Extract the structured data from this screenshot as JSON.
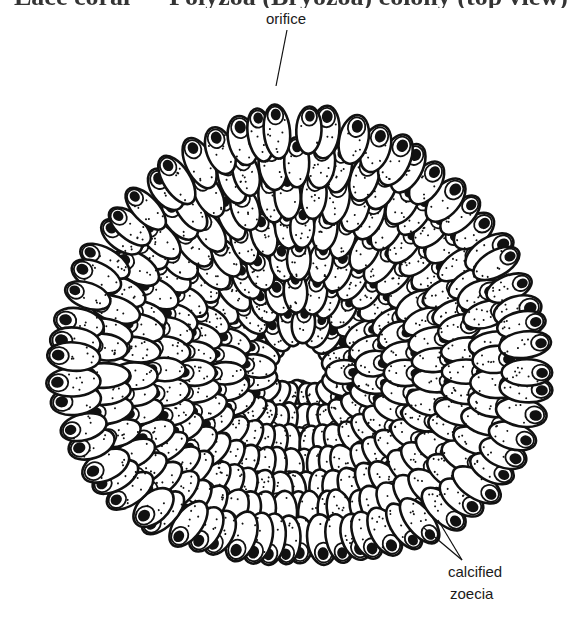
{
  "figure": {
    "title_fragment": "Lace coral — Polyzoa (Bryozoa) colony (top view)",
    "title_visible": "clipped",
    "labels": {
      "orifice": "orifice",
      "calcified": "calcified",
      "zoecia": "zoecia"
    },
    "colors": {
      "ink": "#111111",
      "background": "#ffffff",
      "zooecium_fill": "#ffffff"
    },
    "colony": {
      "center": [
        300,
        372
      ],
      "radius_x": 262,
      "radius_y": 250,
      "top_peak": [
        287,
        92
      ],
      "rings": 8,
      "zooecium_length": 46,
      "zooecium_width": 26
    },
    "leaders": {
      "orifice": {
        "from": [
          287,
          30
        ],
        "to": [
          276,
          86
        ]
      },
      "calcified": [
        {
          "from": [
            462,
            560
          ],
          "to": [
            424,
            528
          ]
        },
        {
          "from": [
            462,
            560
          ],
          "to": [
            438,
            520
          ]
        }
      ]
    }
  }
}
